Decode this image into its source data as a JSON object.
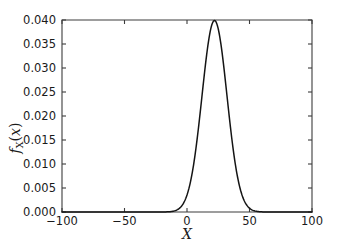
{
  "figure": {
    "background_color": "#ffffff",
    "axis_color": "#3c3c3c",
    "curve_color": "#141414"
  },
  "chart_data": {
    "type": "line",
    "title": "",
    "subtitle": "",
    "xlabel": "X",
    "ylabel": "f_X(x)",
    "ylabel_parts": {
      "base": "f",
      "subscript": "X",
      "open_paren": "(",
      "arg": "x",
      "close_paren": ")"
    },
    "xlim": [
      -100,
      100
    ],
    "ylim": [
      0.0,
      0.04
    ],
    "xticks": [
      -100,
      -50,
      0,
      50,
      100
    ],
    "xtick_labels": [
      "−100",
      "−50",
      "0",
      "50",
      "100"
    ],
    "yticks": [
      0.0,
      0.005,
      0.01,
      0.015,
      0.02,
      0.025,
      0.03,
      0.035,
      0.04
    ],
    "ytick_labels": [
      "0.000",
      "0.005",
      "0.010",
      "0.015",
      "0.020",
      "0.025",
      "0.030",
      "0.035",
      "0.040"
    ],
    "grid": false,
    "legend": null,
    "legend_position": "none",
    "annotations": [],
    "series": [
      {
        "name": "gaussian-pdf",
        "distribution": "normal",
        "mean": 22,
        "std": 10,
        "peak_value": 0.0399,
        "peak_x": 22,
        "color": "#141414",
        "linewidth": 1.5,
        "x": [
          -100,
          -90,
          -80,
          -70,
          -60,
          -50,
          -40,
          -30,
          -25,
          -20,
          -15,
          -10,
          -8,
          -6,
          -4,
          -2,
          0,
          2,
          4,
          6,
          8,
          10,
          12,
          14,
          16,
          18,
          20,
          22,
          24,
          26,
          28,
          30,
          32,
          34,
          36,
          38,
          40,
          42,
          44,
          46,
          48,
          50,
          52,
          54,
          56,
          58,
          60,
          65,
          70,
          80,
          90,
          100
        ],
        "values": [
          0.0,
          0.0,
          0.0,
          0.0,
          0.0,
          0.0,
          0.0,
          0.0,
          0.0,
          0.0,
          1e-05,
          4e-05,
          8e-05,
          0.00014,
          0.00024,
          0.0004,
          0.00063,
          0.00094,
          0.00136,
          0.00194,
          0.00266,
          0.00355,
          0.00457,
          0.00569,
          0.00683,
          0.0079,
          0.0088,
          0.0094,
          0.00967,
          0.00957,
          0.00913,
          0.0084,
          0.00746,
          0.00639,
          0.00528,
          0.00421,
          0.00323,
          0.00239,
          0.0017,
          0.00117,
          0.00077,
          0.00049,
          0.0003,
          0.00018,
          0.0001,
          5e-05,
          3e-05,
          1e-05,
          0.0,
          0.0,
          0.0,
          0.0
        ]
      }
    ]
  }
}
